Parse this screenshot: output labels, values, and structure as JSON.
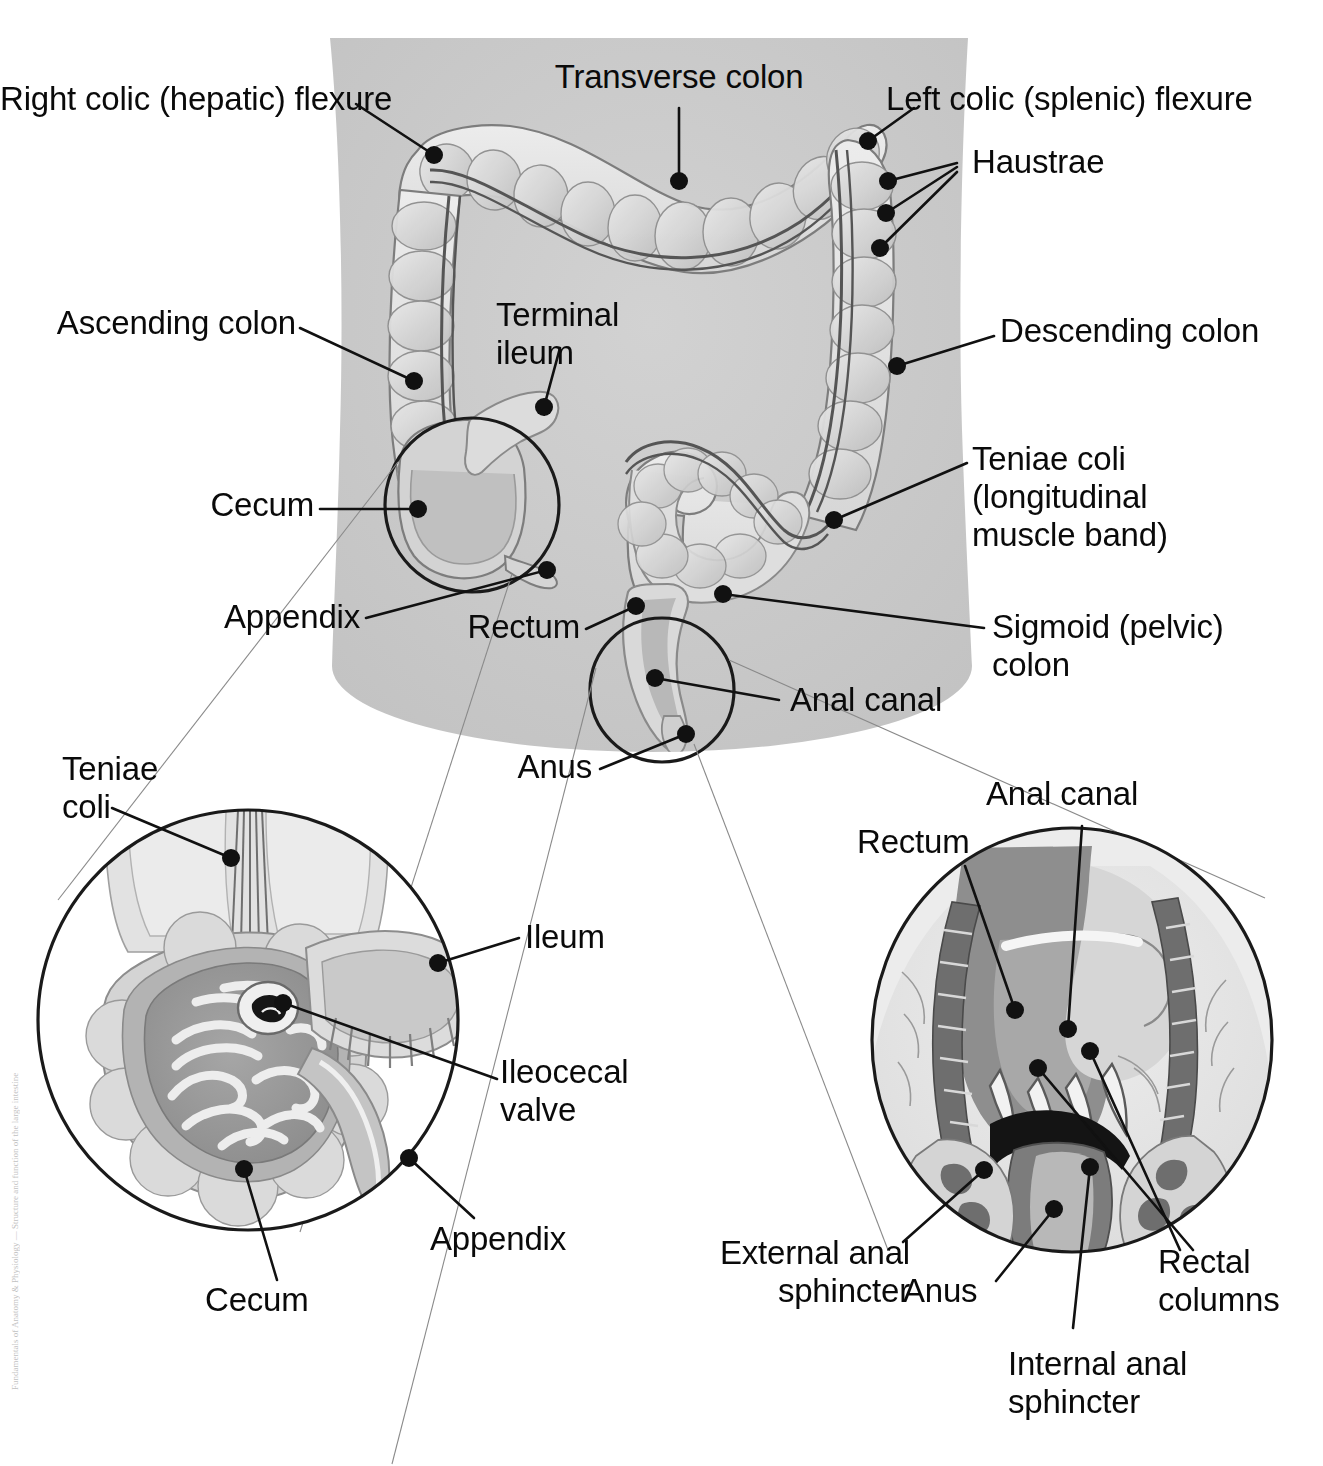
{
  "figure": {
    "background_color": "#ffffff",
    "torso_color": "#c8c8c8",
    "colon_light": "#e4e4e4",
    "colon_mid": "#cfcfcf",
    "colon_dark": "#b0b0b0",
    "line_color": "#111111",
    "width": 1323,
    "height": 1466
  },
  "credit": "Fundamentals of Anatomy & Physiology — Structure and function of the large intestine",
  "labels": {
    "right_colic_flexure": "Right colic (hepatic) flexure",
    "transverse_colon": "Transverse colon",
    "left_colic_flexure": "Left colic (splenic) flexure",
    "haustrae": "Haustrae",
    "ascending_colon": "Ascending colon",
    "terminal_ileum_line1": "Terminal",
    "terminal_ileum_line2": "ileum",
    "descending_colon": "Descending colon",
    "cecum_main": "Cecum",
    "teniae_coli_line1": "Teniae coli",
    "teniae_coli_line2": "(longitudinal",
    "teniae_coli_line3": "muscle band)",
    "appendix_main": "Appendix",
    "rectum_main": "Rectum",
    "sigmoid_colon_line1": "Sigmoid (pelvic)",
    "sigmoid_colon_line2": "colon",
    "anal_canal_main": "Anal canal",
    "anus_main": "Anus",
    "inset_left_teniae_line1": "Teniae",
    "inset_left_teniae_line2": "coli",
    "inset_left_ileum": "Ileum",
    "inset_left_ileocecal_line1": "Ileocecal",
    "inset_left_ileocecal_line2": "valve",
    "inset_left_appendix": "Appendix",
    "inset_left_cecum": "Cecum",
    "inset_right_anal_canal": "Anal canal",
    "inset_right_rectum": "Rectum",
    "inset_right_external_line1": "External anal",
    "inset_right_external_line2": "sphincter",
    "inset_right_anus": "Anus",
    "inset_right_rectal_line1": "Rectal",
    "inset_right_rectal_line2": "columns",
    "inset_right_internal_line1": "Internal anal",
    "inset_right_internal_line2": "sphincter"
  },
  "callouts": [
    {
      "name": "right-colic-flexure",
      "dot": [
        434,
        155
      ]
    },
    {
      "name": "transverse-colon",
      "dot": [
        679,
        181
      ]
    },
    {
      "name": "left-colic-flexure",
      "dot": [
        868,
        141
      ]
    },
    {
      "name": "haustrae-1",
      "dot": [
        888,
        181
      ]
    },
    {
      "name": "haustrae-2",
      "dot": [
        886,
        213
      ]
    },
    {
      "name": "haustrae-3",
      "dot": [
        880,
        248
      ]
    },
    {
      "name": "ascending-colon",
      "dot": [
        414,
        381
      ]
    },
    {
      "name": "terminal-ileum",
      "dot": [
        544,
        407
      ]
    },
    {
      "name": "descending-colon",
      "dot": [
        897,
        366
      ]
    },
    {
      "name": "cecum-main",
      "dot": [
        418,
        509
      ]
    },
    {
      "name": "teniae-coli-main",
      "dot": [
        834,
        520
      ]
    },
    {
      "name": "appendix-main",
      "dot": [
        547,
        570
      ]
    },
    {
      "name": "rectum-main",
      "dot": [
        636,
        606
      ]
    },
    {
      "name": "sigmoid-colon",
      "dot": [
        723,
        594
      ]
    },
    {
      "name": "anal-canal-main",
      "dot": [
        655,
        678
      ]
    },
    {
      "name": "anus-main",
      "dot": [
        686,
        734
      ]
    },
    {
      "name": "inset-left-teniae",
      "dot": [
        231,
        858
      ]
    },
    {
      "name": "inset-left-ileum",
      "dot": [
        438,
        963
      ]
    },
    {
      "name": "inset-left-ileocecal",
      "dot": [
        283,
        1003
      ]
    },
    {
      "name": "inset-left-appendix",
      "dot": [
        409,
        1158
      ]
    },
    {
      "name": "inset-left-cecum",
      "dot": [
        244,
        1169
      ]
    },
    {
      "name": "inset-right-rectum",
      "dot": [
        1015,
        1010
      ]
    },
    {
      "name": "inset-right-anal-canal",
      "dot": [
        1068,
        1029
      ]
    },
    {
      "name": "inset-right-external",
      "dot": [
        984,
        1170
      ]
    },
    {
      "name": "inset-right-anus",
      "dot": [
        1054,
        1209
      ]
    },
    {
      "name": "inset-right-rectal-col-a",
      "dot": [
        1038,
        1068
      ]
    },
    {
      "name": "inset-right-rectal-col-b",
      "dot": [
        1090,
        1051
      ]
    },
    {
      "name": "inset-right-internal",
      "dot": [
        1090,
        1167
      ]
    }
  ]
}
